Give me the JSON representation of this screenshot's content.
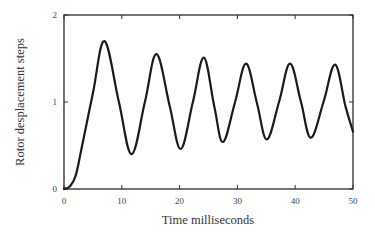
{
  "chart_data": {
    "type": "line",
    "title": "",
    "xlabel": "Time milliseconds",
    "ylabel": "Rotor desplacement steps",
    "xlim": [
      0,
      50
    ],
    "ylim": [
      0,
      2
    ],
    "xticks": [
      0,
      10,
      20,
      30,
      40,
      50
    ],
    "yticks": [
      0,
      1,
      2
    ],
    "xtick_labels": [
      "0",
      "10",
      "20",
      "30",
      "40",
      "50"
    ],
    "ytick_labels": [
      "0",
      "1",
      "2"
    ],
    "grid": false,
    "legend": null,
    "series": [
      {
        "name": "Rotor displacement",
        "x": [
          0,
          1,
          2,
          3,
          5,
          7.0,
          9.5,
          11.7,
          14,
          16.0,
          18.3,
          20.2,
          22.3,
          24.2,
          26,
          27.5,
          29.6,
          31.5,
          33.4,
          35.1,
          37.2,
          39.1,
          41,
          42.7,
          44.9,
          46.9,
          48.7,
          50
        ],
        "y": [
          0,
          0.03,
          0.15,
          0.45,
          1.1,
          1.7,
          1.0,
          0.4,
          1.0,
          1.55,
          0.95,
          0.46,
          1.0,
          1.51,
          0.95,
          0.54,
          1.0,
          1.44,
          0.98,
          0.57,
          1.0,
          1.44,
          1.0,
          0.59,
          1.0,
          1.43,
          0.95,
          0.66
        ]
      }
    ]
  }
}
